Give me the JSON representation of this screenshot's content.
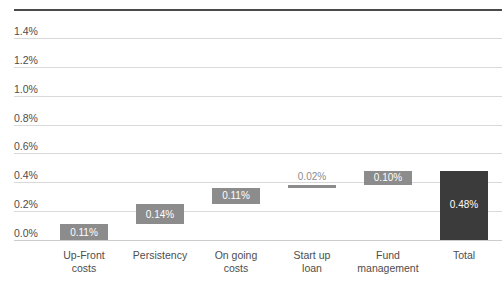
{
  "chart_data": {
    "type": "bar",
    "chart_style": "waterfall",
    "title": "",
    "xlabel": "",
    "ylabel": "",
    "ylim": [
      0.0,
      1.4
    ],
    "ytick_step": 0.2,
    "grid": true,
    "legend": false,
    "y_tick_labels": [
      "1.4%",
      "1.2%",
      "1.0%",
      "0.8%",
      "0.6%",
      "0.4%",
      "0.2%",
      "0.0%"
    ],
    "y_tick_values": [
      1.4,
      1.2,
      1.0,
      0.8,
      0.6,
      0.4,
      0.2,
      0.0
    ],
    "categories": [
      "Up-Front\ncosts",
      "Persistency",
      "On going\ncosts",
      "Start up\nloan",
      "Fund\nmanagement",
      "Total"
    ],
    "values": [
      0.11,
      0.14,
      0.11,
      0.02,
      0.1,
      0.48
    ],
    "bases": [
      0.0,
      0.11,
      0.25,
      0.36,
      0.38,
      0.0
    ],
    "data_labels": [
      "0.11%",
      "0.14%",
      "0.11%",
      "0.02%",
      "0.10%",
      "0.48%"
    ],
    "bar_colors": [
      "#8c8c8c",
      "#8c8c8c",
      "#8c8c8c",
      "#8c8c8c",
      "#8c8c8c",
      "#3b3b3b"
    ],
    "label_inside": [
      true,
      true,
      true,
      false,
      true,
      true
    ],
    "bars": [
      {
        "category": "Up-Front\ncosts",
        "value": 0.11,
        "base": 0.0,
        "label": "0.11%",
        "color": "#8c8c8c",
        "kind": "increase"
      },
      {
        "category": "Persistency",
        "value": 0.14,
        "base": 0.11,
        "label": "0.14%",
        "color": "#8c8c8c",
        "kind": "increase"
      },
      {
        "category": "On going\ncosts",
        "value": 0.11,
        "base": 0.25,
        "label": "0.11%",
        "color": "#8c8c8c",
        "kind": "increase"
      },
      {
        "category": "Start up\nloan",
        "value": 0.02,
        "base": 0.36,
        "label": "0.02%",
        "color": "#8c8c8c",
        "kind": "increase"
      },
      {
        "category": "Fund\nmanagement",
        "value": 0.1,
        "base": 0.38,
        "label": "0.10%",
        "color": "#8c8c8c",
        "kind": "increase"
      },
      {
        "category": "Total",
        "value": 0.48,
        "base": 0.0,
        "label": "0.48%",
        "color": "#3b3b3b",
        "kind": "total"
      }
    ]
  },
  "axis": {
    "ticks": [
      {
        "label": "1.4%"
      },
      {
        "label": "1.2%"
      },
      {
        "label": "1.0%"
      },
      {
        "label": "0.8%"
      },
      {
        "label": "0.6%"
      },
      {
        "label": "0.4%"
      },
      {
        "label": "0.2%"
      },
      {
        "label": "0.0%"
      }
    ]
  },
  "categories": [
    {
      "label": "Up-Front\ncosts"
    },
    {
      "label": "Persistency"
    },
    {
      "label": "On going\ncosts"
    },
    {
      "label": "Start up\nloan"
    },
    {
      "label": "Fund\nmanagement"
    },
    {
      "label": "Total"
    }
  ],
  "colors": {
    "bar_default": "#8c8c8c",
    "bar_total": "#3b3b3b",
    "gridline": "#d9d9d9",
    "top_rule": "#4a4a4a",
    "tick_text": "#4d4d4d",
    "label_inside_text": "#ffffff",
    "label_outside_text": "#8c8c8c"
  }
}
